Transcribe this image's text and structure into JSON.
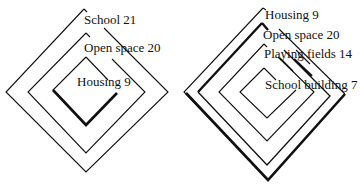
{
  "diagrams": [
    {
      "name": "left-nested-diamonds",
      "layers": [
        {
          "label": "School 21",
          "name": "School",
          "value": 21
        },
        {
          "label": "Open space 20",
          "name": "Open space",
          "value": 20
        },
        {
          "label": "Housing 9",
          "name": "Housing",
          "value": 9
        }
      ]
    },
    {
      "name": "right-nested-diamonds",
      "layers": [
        {
          "label": "Housing 9",
          "name": "Housing",
          "value": 9
        },
        {
          "label": "Open space 20",
          "name": "Open space",
          "value": 20
        },
        {
          "label": "Playing fields 14",
          "name": "Playing fields",
          "value": 14
        },
        {
          "label": "School building 7",
          "name": "School building",
          "value": 7
        }
      ]
    }
  ],
  "colors": {
    "line": "#111111",
    "background": "#ffffff"
  }
}
